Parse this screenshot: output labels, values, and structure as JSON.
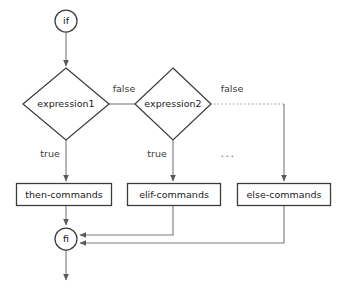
{
  "diagram": {
    "type": "flowchart",
    "colors": {
      "background": "#ffffff",
      "shape_stroke": "#3c3c3c",
      "connector": "#7a7a7a",
      "dotted_connector": "#9a9a9a",
      "text": "#1a1a1a"
    },
    "nodes": {
      "start": {
        "label": "if",
        "shape": "circle"
      },
      "decision1": {
        "label": "expression1",
        "shape": "diamond"
      },
      "decision2": {
        "label": "expression2",
        "shape": "diamond"
      },
      "then_box": {
        "label": "then-commands",
        "shape": "rectangle"
      },
      "elif_box": {
        "label": "elif-commands",
        "shape": "rectangle"
      },
      "else_box": {
        "label": "else-commands",
        "shape": "rectangle"
      },
      "end": {
        "label": "fi",
        "shape": "circle"
      }
    },
    "edge_labels": {
      "false1": "false",
      "false2": "false",
      "true1": "true",
      "true2": "true",
      "ellipsis": "..."
    }
  }
}
